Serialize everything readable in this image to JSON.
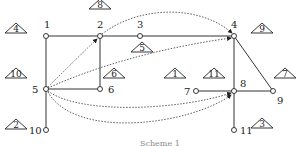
{
  "diagram": {
    "caption": "Scheme 1",
    "nodes": [
      {
        "id": "1",
        "x": 46,
        "y": 36,
        "lx": 44,
        "ly": 28
      },
      {
        "id": "2",
        "x": 100,
        "y": 36,
        "lx": 97,
        "ly": 28
      },
      {
        "id": "3",
        "x": 140,
        "y": 36,
        "lx": 137,
        "ly": 28
      },
      {
        "id": "4",
        "x": 234,
        "y": 36,
        "lx": 231,
        "ly": 28
      },
      {
        "id": "5",
        "x": 46,
        "y": 89,
        "lx": 32,
        "ly": 93
      },
      {
        "id": "6",
        "x": 100,
        "y": 89,
        "lx": 108,
        "ly": 93
      },
      {
        "id": "7",
        "x": 196,
        "y": 91,
        "lx": 184,
        "ly": 95
      },
      {
        "id": "8",
        "x": 234,
        "y": 91,
        "lx": 240,
        "ly": 87
      },
      {
        "id": "9",
        "x": 273,
        "y": 91,
        "lx": 277,
        "ly": 104
      },
      {
        "id": "10",
        "x": 46,
        "y": 130,
        "lx": 29,
        "ly": 134
      },
      {
        "id": "11",
        "x": 234,
        "y": 130,
        "lx": 240,
        "ly": 134
      }
    ],
    "edges": [
      [
        "1",
        "2"
      ],
      [
        "2",
        "3"
      ],
      [
        "3",
        "4"
      ],
      [
        "1",
        "5"
      ],
      [
        "2",
        "6"
      ],
      [
        "5",
        "6"
      ],
      [
        "5",
        "10"
      ],
      [
        "4",
        "8"
      ],
      [
        "4",
        "9"
      ],
      [
        "7",
        "8"
      ],
      [
        "8",
        "9"
      ],
      [
        "8",
        "11"
      ]
    ],
    "arrows": [
      {
        "from": "5",
        "to": "2",
        "path": "M48,87 Q75,60 97,39"
      },
      {
        "from": "2",
        "to": "4",
        "path": "M102,34 C140,5 200,5 232,33"
      },
      {
        "from": "5",
        "to": "4",
        "path": "M48,88 C110,60 180,45 231,38"
      },
      {
        "from": "5",
        "to": "8",
        "path": "M48,91 C80,115 180,110 231,93"
      },
      {
        "from": "5",
        "to": "8b",
        "path": "M48,92 C75,140 190,125 231,95"
      }
    ],
    "triangles": [
      {
        "label": "1",
        "x": 175,
        "y": 78
      },
      {
        "label": "2",
        "x": 16,
        "y": 129
      },
      {
        "label": "3",
        "x": 262,
        "y": 128
      },
      {
        "label": "4",
        "x": 16,
        "y": 33
      },
      {
        "label": "5",
        "x": 142,
        "y": 52
      },
      {
        "label": "6",
        "x": 114,
        "y": 78
      },
      {
        "label": "7",
        "x": 285,
        "y": 78
      },
      {
        "label": "8",
        "x": 100,
        "y": 9
      },
      {
        "label": "9",
        "x": 262,
        "y": 33
      },
      {
        "label": "10",
        "x": 16,
        "y": 78
      },
      {
        "label": "11",
        "x": 214,
        "y": 78
      }
    ]
  }
}
